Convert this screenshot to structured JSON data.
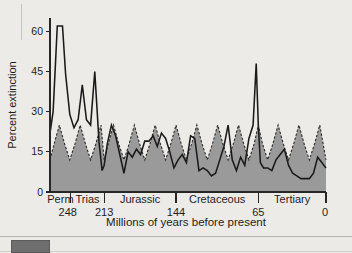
{
  "figure": {
    "ylabel": "Percent extinction",
    "xlabel": "Millions of years before present",
    "y_ticks": [
      "0",
      "15",
      "30",
      "45",
      "60"
    ],
    "x_age_ticks": [
      "248",
      "213",
      "144",
      "65",
      "0"
    ],
    "periods": [
      "Perm",
      "Trias",
      "Jurassic",
      "Cretaceous",
      "Tertiary"
    ]
  },
  "scrollbar": {
    "thumb_label": "horizontal-scroll-thumb"
  },
  "colors": {
    "page_background": "#edebe7",
    "fill_gray": "#9a9a9a",
    "line_black": "#1a1a1a",
    "scroll_thumb": "#6e6e6e"
  },
  "chart_data": {
    "type": "line",
    "title": "",
    "xlabel": "Millions of years before present",
    "ylabel": "Percent extinction",
    "xlim": [
      265,
      0
    ],
    "ylim": [
      0,
      65
    ],
    "y_ticks": [
      0,
      15,
      30,
      45,
      60
    ],
    "x_ticks": [
      248,
      213,
      144,
      65,
      0
    ],
    "x_axis_reversed": true,
    "grid": false,
    "legend": false,
    "period_bands": [
      {
        "name": "Perm",
        "start": 265,
        "end": 245
      },
      {
        "name": "Trias",
        "start": 245,
        "end": 213
      },
      {
        "name": "Jurassic",
        "start": 213,
        "end": 144
      },
      {
        "name": "Cretaceous",
        "start": 144,
        "end": 65
      },
      {
        "name": "Tertiary",
        "start": 65,
        "end": 0
      }
    ],
    "series": [
      {
        "name": "Observed percent extinction",
        "style": "solid",
        "x": [
          265,
          262,
          258,
          253,
          250,
          246,
          242,
          238,
          234,
          230,
          226,
          222,
          218,
          215,
          213,
          210,
          206,
          202,
          198,
          194,
          190,
          186,
          182,
          178,
          174,
          170,
          166,
          162,
          158,
          154,
          150,
          146,
          142,
          138,
          134,
          130,
          126,
          122,
          118,
          114,
          110,
          106,
          102,
          98,
          94,
          90,
          86,
          82,
          78,
          74,
          70,
          67,
          65,
          63,
          60,
          56,
          52,
          48,
          44,
          40,
          36,
          32,
          28,
          24,
          20,
          16,
          12,
          8,
          4,
          0
        ],
        "y": [
          22,
          30,
          62,
          62,
          44,
          29,
          24,
          27,
          40,
          27,
          25,
          45,
          19,
          8,
          10,
          18,
          25,
          21,
          14,
          7,
          15,
          13,
          16,
          14,
          19,
          19,
          21,
          17,
          22,
          20,
          15,
          9,
          12,
          14,
          11,
          21,
          20,
          8,
          9,
          8,
          6,
          7,
          12,
          17,
          25,
          12,
          8,
          13,
          10,
          20,
          25,
          48,
          25,
          11,
          9,
          9,
          8,
          12,
          14,
          16,
          10,
          7,
          6,
          5,
          5,
          5,
          7,
          13,
          11,
          9
        ]
      },
      {
        "name": "Expected (baseline) percent extinction",
        "style": "dashed-with-fill",
        "x": [
          265,
          261,
          256,
          251,
          246,
          241,
          236,
          231,
          226,
          221,
          216,
          213,
          209,
          204,
          199,
          194,
          189,
          184,
          179,
          174,
          169,
          164,
          159,
          154,
          149,
          144,
          139,
          134,
          129,
          124,
          119,
          114,
          109,
          104,
          99,
          94,
          89,
          84,
          79,
          74,
          69,
          65,
          61,
          56,
          51,
          46,
          41,
          36,
          31,
          26,
          21,
          16,
          11,
          6,
          0
        ],
        "y": [
          12,
          18,
          25,
          18,
          12,
          18,
          25,
          18,
          12,
          18,
          25,
          12,
          18,
          25,
          18,
          12,
          18,
          25,
          18,
          12,
          18,
          25,
          18,
          12,
          18,
          25,
          18,
          12,
          18,
          25,
          18,
          12,
          18,
          25,
          18,
          12,
          18,
          25,
          18,
          12,
          18,
          25,
          18,
          12,
          18,
          25,
          18,
          12,
          18,
          25,
          18,
          12,
          18,
          25,
          12
        ]
      }
    ]
  }
}
